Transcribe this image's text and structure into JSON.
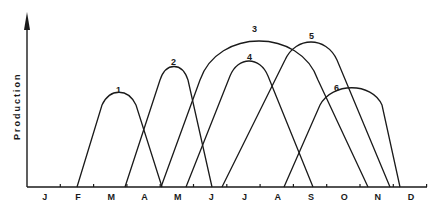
{
  "chart_data": {
    "type": "line",
    "title": "",
    "xlabel": "",
    "ylabel": "Production",
    "grid": false,
    "legend": "none (curves labelled 1-6 at peaks)",
    "categories": [
      "J",
      "F",
      "M",
      "A",
      "M",
      "J",
      "J",
      "A",
      "S",
      "O",
      "N",
      "D"
    ],
    "ylim": [
      0,
      1
    ],
    "series": [
      {
        "name": "1",
        "start_month": 1.5,
        "peak_month": 2.75,
        "end_month": 4.05,
        "peak_relative": 0.53
      },
      {
        "name": "2",
        "start_month": 2.95,
        "peak_month": 4.4,
        "end_month": 5.55,
        "peak_relative": 0.69
      },
      {
        "name": "3",
        "start_month": 4.0,
        "peak_month": 6.95,
        "end_month": 10.2,
        "peak_relative": 0.87
      },
      {
        "name": "4",
        "start_month": 4.75,
        "peak_month": 6.7,
        "end_month": 8.6,
        "peak_relative": 0.72
      },
      {
        "name": "5",
        "start_month": 5.85,
        "peak_month": 8.5,
        "end_month": 10.9,
        "peak_relative": 0.84
      },
      {
        "name": "6",
        "start_month": 7.7,
        "peak_month": 9.7,
        "end_month": 11.2,
        "peak_relative": 0.55
      }
    ]
  },
  "axis": {
    "ylabel": "Production",
    "months": [
      "J",
      "F",
      "M",
      "A",
      "M",
      "J",
      "J",
      "A",
      "S",
      "O",
      "N",
      "D"
    ]
  },
  "curves": [
    {
      "label": "1",
      "path": "M77,187 L102,105 C110,88 128,88 136,105 L162,187"
    },
    {
      "label": "2",
      "path": "M125,187 L160,80 C166,62 182,62 188,80 L212,187"
    },
    {
      "label": "3",
      "path": "M161,187 L200,80 C218,28 300,28 318,80 L368,187"
    },
    {
      "label": "4",
      "path": "M186,187 L230,76 C238,56 260,56 268,76 L313,187"
    },
    {
      "label": "5",
      "path": "M222,187 L285,60 C296,36 326,36 337,60 L390,187"
    },
    {
      "label": "6",
      "path": "M284,187 L320,105 C332,82 372,82 382,105 L400,187"
    }
  ]
}
